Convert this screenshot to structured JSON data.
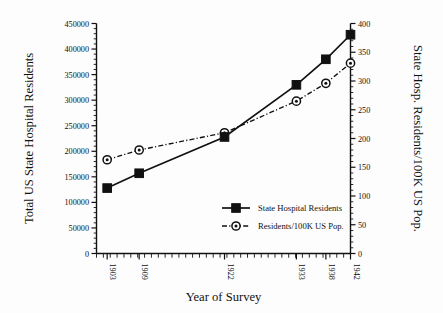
{
  "chart_data": {
    "type": "line",
    "title": "",
    "xlabel": "Year of Survey",
    "ylabel": "Total US State Hospital Residents",
    "y2label": "State Hosp. Residents/100K US Pop.",
    "categories": [
      "1903",
      "1909",
      "1922",
      "1933",
      "1938",
      "1942"
    ],
    "x": [
      1903,
      1909,
      1922,
      1933,
      1938,
      1942
    ],
    "ylim": [
      0,
      450000
    ],
    "y2lim": [
      0,
      400
    ],
    "yticks": [
      "0",
      "50000",
      "100000",
      "150000",
      "200000",
      "250000",
      "300000",
      "350000",
      "400000",
      "450000"
    ],
    "ytickvalues": [
      0,
      50000,
      100000,
      150000,
      200000,
      250000,
      300000,
      350000,
      400000,
      450000
    ],
    "y2ticks": [
      "0",
      "50",
      "100",
      "150",
      "200",
      "250",
      "300",
      "350",
      "400"
    ],
    "y2tickvalues": [
      0,
      50,
      100,
      150,
      200,
      250,
      300,
      350,
      400
    ],
    "grid": false,
    "legend_position": "lower-right-inside",
    "series": [
      {
        "name": "State Hospital Residents",
        "axis": "left",
        "marker": "filled-square",
        "linestyle": "solid",
        "color": "#111111",
        "values": [
          128000,
          157000,
          228000,
          330000,
          380000,
          428000
        ]
      },
      {
        "name": "Residents/100K US Pop.",
        "axis": "right",
        "marker": "circle-dot",
        "linestyle": "dash-dot",
        "color": "#111111",
        "values": [
          163,
          180,
          210,
          265,
          296,
          331
        ]
      }
    ]
  },
  "legend": {
    "items": [
      {
        "label": "State Hospital Residents"
      },
      {
        "label": "Residents/100K US Pop."
      }
    ]
  }
}
